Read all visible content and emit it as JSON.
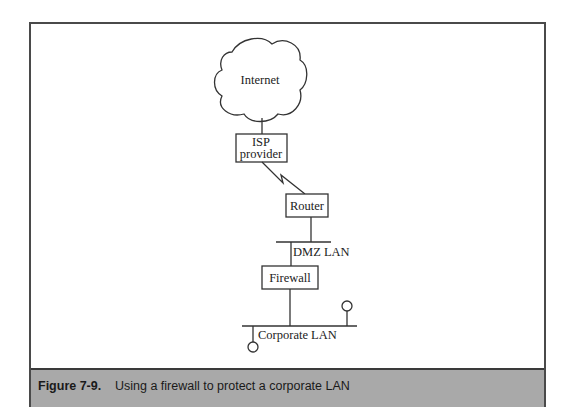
{
  "figure": {
    "label": "Figure 7-9.",
    "caption": "Using a firewall to protect a corporate LAN"
  },
  "diagram": {
    "cloud": {
      "label": "Internet"
    },
    "isp": {
      "line1": "ISP",
      "line2": "provider"
    },
    "router": {
      "label": "Router"
    },
    "dmz": {
      "label": "DMZ LAN"
    },
    "firewall": {
      "label": "Firewall"
    },
    "corporate": {
      "label": "Corporate LAN"
    }
  },
  "colors": {
    "frame": "#4a4a4a",
    "caption_bg": "#a9a9a9",
    "line": "#333333"
  }
}
